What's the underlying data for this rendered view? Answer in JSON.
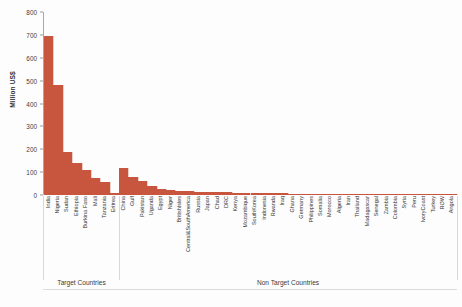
{
  "chart_data": {
    "type": "bar",
    "title": "",
    "subtitle": "",
    "xlabel": "",
    "ylabel": "Million US$",
    "ylim": [
      0,
      800
    ],
    "yticks": [
      0,
      100,
      200,
      300,
      400,
      500,
      600,
      700,
      800
    ],
    "grid": false,
    "legend": null,
    "bar_color": "#c8553d",
    "categories": [
      "India",
      "Nigeria",
      "Sudan",
      "Ethiopia",
      "Burkina Faso",
      "Mali",
      "Tanzania",
      "Eritrea",
      "China",
      "Gulf",
      "Pakistan",
      "Uganda",
      "Egypt",
      "Niger",
      "BritishIsles",
      "Central&SouthAmerica",
      "Russia",
      "Japan",
      "Chad",
      "DRC",
      "Kenya",
      "Mozambique",
      "SouthKorea",
      "Indonesia",
      "Rwanda",
      "Iraq",
      "Ghana",
      "Germany",
      "Philippines",
      "Somalia",
      "Morocco",
      "Algeria",
      "Iran",
      "Thailand",
      "Madagascar",
      "Senegal",
      "Zambia",
      "Colombia",
      "Syria",
      "Peru",
      "IvoryCoast",
      "Turkey",
      "ROW",
      "Angola"
    ],
    "values": [
      695,
      480,
      188,
      140,
      110,
      75,
      55,
      10,
      118,
      78,
      60,
      38,
      28,
      22,
      18,
      16,
      14,
      13,
      12,
      11,
      10,
      9,
      8.5,
      8,
      7.5,
      7,
      6.5,
      6,
      5.5,
      5,
      4.6,
      4.2,
      3.9,
      3.6,
      3.3,
      3.0,
      2.8,
      2.5,
      2.2,
      2.0,
      1.7,
      1.4,
      1.1,
      0.8
    ],
    "groups": [
      {
        "label": "Target Countries",
        "start": 0,
        "end": 7
      },
      {
        "label": "Non Target Countries",
        "start": 8,
        "end": 43
      }
    ]
  }
}
